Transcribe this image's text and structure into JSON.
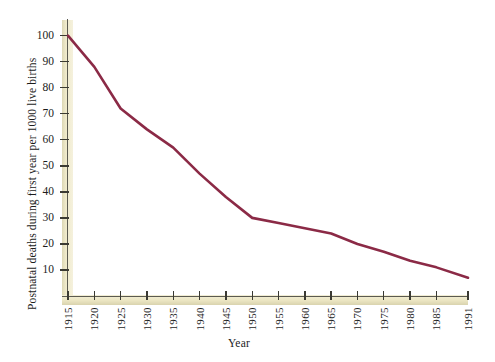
{
  "chart_data": {
    "type": "line",
    "title": "",
    "xlabel": "Year",
    "ylabel": "Postnatal deaths during first year per 1000 live births",
    "x": [
      1915,
      1920,
      1925,
      1930,
      1935,
      1940,
      1945,
      1950,
      1955,
      1960,
      1965,
      1970,
      1975,
      1980,
      1985,
      1991
    ],
    "values": [
      100,
      88,
      72,
      64,
      57,
      47,
      38,
      30,
      28,
      26,
      24,
      20,
      17,
      13.5,
      11,
      7
    ],
    "series": [
      {
        "name": "Postnatal deaths per 1000 live births",
        "values": [
          100,
          88,
          72,
          64,
          57,
          47,
          38,
          30,
          28,
          26,
          24,
          20,
          17,
          13.5,
          11,
          7
        ]
      }
    ],
    "xtick_labels": [
      "1915",
      "1920",
      "1925",
      "1930",
      "1935",
      "1940",
      "1945",
      "1950",
      "1955",
      "1960",
      "1965",
      "1970",
      "1975",
      "1980",
      "1985",
      "1991"
    ],
    "ytick_labels": [
      "10",
      "20",
      "30",
      "40",
      "50",
      "60",
      "70",
      "80",
      "90",
      "100"
    ],
    "ytick_values": [
      10,
      20,
      30,
      40,
      50,
      60,
      70,
      80,
      90,
      100
    ],
    "xlim": [
      1915,
      1991
    ],
    "ylim": [
      0,
      106
    ],
    "grid": false,
    "legend": "none",
    "line_color": "#8b2a46",
    "axis_band_color": "#ebe5c2",
    "axis_rule_color": "#5b5a50",
    "background_color": "#ffffff"
  }
}
